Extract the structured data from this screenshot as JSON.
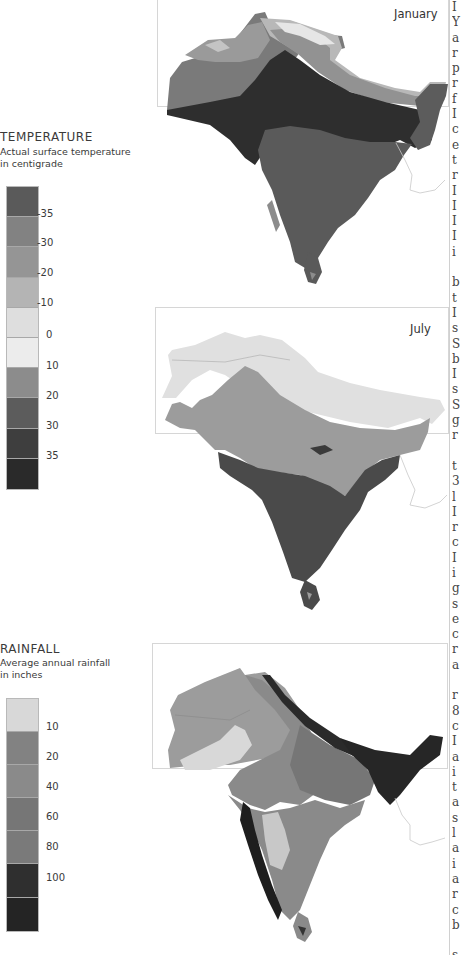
{
  "temperature_legend": {
    "title": "TEMPERATURE",
    "subtitle_line1": "Actual surface temperature",
    "subtitle_line2": "in centigrade",
    "classes": [
      {
        "color": "#5a5a5a"
      },
      {
        "color": "#828282"
      },
      {
        "color": "#959595"
      },
      {
        "color": "#b4b4b4"
      },
      {
        "color": "#dedede"
      },
      {
        "color": "#ececec"
      },
      {
        "color": "#8c8c8c"
      },
      {
        "color": "#5c5c5c"
      },
      {
        "color": "#3e3e3e"
      },
      {
        "color": "#2a2a2a"
      }
    ],
    "ticks": [
      "-35",
      "-30",
      "-20",
      "-10",
      "0",
      "10",
      "20",
      "30",
      "35"
    ]
  },
  "rainfall_legend": {
    "title": "RAINFALL",
    "subtitle_line1": "Average annual rainfall",
    "subtitle_line2": "in  inches",
    "classes": [
      {
        "color": "#d8d8d8"
      },
      {
        "color": "#828282"
      },
      {
        "color": "#8a8a8a"
      },
      {
        "color": "#767676"
      },
      {
        "color": "#7a7a7a"
      },
      {
        "color": "#2f2f2f"
      },
      {
        "color": "#242424"
      }
    ],
    "ticks": [
      "10",
      "20",
      "40",
      "60",
      "80",
      "100"
    ]
  },
  "maps": {
    "january": {
      "label": "January"
    },
    "july": {
      "label": "July"
    },
    "rainfall": {
      "label": ""
    }
  },
  "text_column": {
    "fragments": "I\nY\na\nr\np\nr\nf\nI\nc\ne\nt\nr\nI\nI\nI\nI\ni\n\nb\nt\nI\ns\nS\nb\nI\ns\nS\ng\nr\n\nt\n3\nl\nI\nr\nc\nI\ni\ng\ns\ne\nc\nr\na\n\nr\n8\nc\nI\na\ni\nt\na\ns\nl\na\ni\na\nr\nc\nb\n\ns\nf\ng\na\nc\na\nI"
  }
}
